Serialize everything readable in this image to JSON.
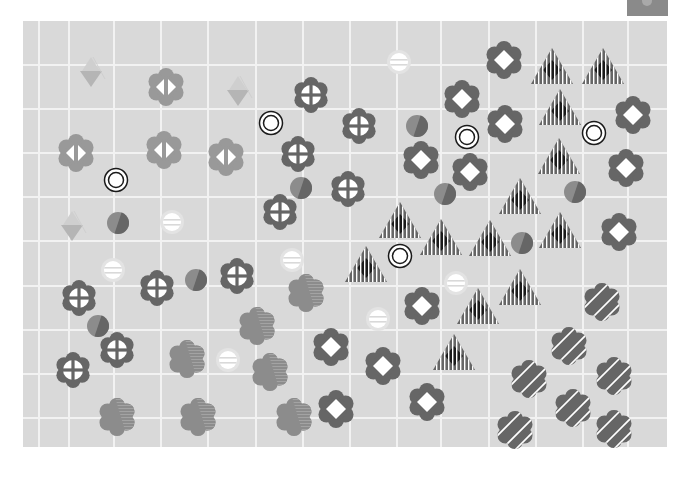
{
  "game": {
    "title": "Pattern Board",
    "corner_button": {
      "label": "",
      "icon": "menu-icon"
    },
    "board": {
      "x": 23,
      "y": 21,
      "width": 644,
      "height": 426,
      "background": "#d9d9d9",
      "grid_color": "#f2f2f2",
      "vlines": [
        15,
        45,
        90,
        137,
        184,
        232,
        279,
        326,
        373,
        417,
        465,
        512,
        559,
        604
      ],
      "hlines": [
        43,
        87,
        131,
        175,
        219,
        264,
        308,
        352,
        396
      ]
    },
    "colors": {
      "dark": "#666666",
      "mid": "#8c8c8c",
      "light": "#999999",
      "faint": "#b5b5b5",
      "white": "#ffffff",
      "black": "#1a1a1a"
    },
    "pieces": [
      {
        "type": "tri-down",
        "x": 91,
        "y": 73
      },
      {
        "type": "tri-down",
        "x": 238,
        "y": 92
      },
      {
        "type": "tri-down",
        "x": 72,
        "y": 227
      },
      {
        "type": "lr-flower",
        "x": 166,
        "y": 87
      },
      {
        "type": "lr-flower",
        "x": 76,
        "y": 153
      },
      {
        "type": "lr-flower",
        "x": 164,
        "y": 150
      },
      {
        "type": "lr-flower",
        "x": 226,
        "y": 157
      },
      {
        "type": "ring",
        "x": 271,
        "y": 123
      },
      {
        "type": "ring",
        "x": 116,
        "y": 180
      },
      {
        "type": "ring",
        "x": 467,
        "y": 137
      },
      {
        "type": "ring",
        "x": 594,
        "y": 133
      },
      {
        "type": "ring",
        "x": 400,
        "y": 256
      },
      {
        "type": "bar-dot",
        "x": 399,
        "y": 62
      },
      {
        "type": "bar-dot",
        "x": 172,
        "y": 222
      },
      {
        "type": "bar-dot",
        "x": 113,
        "y": 270
      },
      {
        "type": "bar-dot",
        "x": 292,
        "y": 260
      },
      {
        "type": "bar-dot",
        "x": 456,
        "y": 283
      },
      {
        "type": "bar-dot",
        "x": 378,
        "y": 319
      },
      {
        "type": "bar-dot",
        "x": 228,
        "y": 360
      },
      {
        "type": "cross-flower",
        "x": 311,
        "y": 95
      },
      {
        "type": "cross-flower",
        "x": 359,
        "y": 126
      },
      {
        "type": "cross-flower",
        "x": 298,
        "y": 154
      },
      {
        "type": "cross-flower",
        "x": 348,
        "y": 189
      },
      {
        "type": "cross-flower",
        "x": 280,
        "y": 212
      },
      {
        "type": "cross-flower",
        "x": 237,
        "y": 276
      },
      {
        "type": "cross-flower",
        "x": 157,
        "y": 288
      },
      {
        "type": "cross-flower",
        "x": 79,
        "y": 298
      },
      {
        "type": "cross-flower",
        "x": 117,
        "y": 350
      },
      {
        "type": "cross-flower",
        "x": 73,
        "y": 370
      },
      {
        "type": "half-dot",
        "x": 417,
        "y": 126
      },
      {
        "type": "half-dot",
        "x": 301,
        "y": 188
      },
      {
        "type": "half-dot",
        "x": 445,
        "y": 194
      },
      {
        "type": "half-dot",
        "x": 118,
        "y": 223
      },
      {
        "type": "half-dot",
        "x": 196,
        "y": 280
      },
      {
        "type": "half-dot",
        "x": 575,
        "y": 192
      },
      {
        "type": "half-dot",
        "x": 522,
        "y": 243
      },
      {
        "type": "half-dot",
        "x": 98,
        "y": 326
      },
      {
        "type": "diamond-flower",
        "x": 504,
        "y": 60
      },
      {
        "type": "diamond-flower",
        "x": 462,
        "y": 99
      },
      {
        "type": "diamond-flower",
        "x": 633,
        "y": 115
      },
      {
        "type": "diamond-flower",
        "x": 505,
        "y": 124
      },
      {
        "type": "diamond-flower",
        "x": 421,
        "y": 160
      },
      {
        "type": "diamond-flower",
        "x": 470,
        "y": 172
      },
      {
        "type": "diamond-flower",
        "x": 626,
        "y": 168
      },
      {
        "type": "diamond-flower",
        "x": 619,
        "y": 232
      },
      {
        "type": "diamond-flower",
        "x": 422,
        "y": 306
      },
      {
        "type": "diamond-flower",
        "x": 331,
        "y": 347
      },
      {
        "type": "diamond-flower",
        "x": 383,
        "y": 366
      },
      {
        "type": "diamond-flower",
        "x": 336,
        "y": 409
      },
      {
        "type": "diamond-flower",
        "x": 427,
        "y": 402
      },
      {
        "type": "tri-stripe",
        "x": 552,
        "y": 66
      },
      {
        "type": "tri-stripe",
        "x": 603,
        "y": 66
      },
      {
        "type": "tri-stripe",
        "x": 560,
        "y": 107
      },
      {
        "type": "tri-stripe",
        "x": 559,
        "y": 156
      },
      {
        "type": "tri-stripe",
        "x": 520,
        "y": 196
      },
      {
        "type": "tri-stripe",
        "x": 400,
        "y": 220
      },
      {
        "type": "tri-stripe",
        "x": 441,
        "y": 237
      },
      {
        "type": "tri-stripe",
        "x": 490,
        "y": 238
      },
      {
        "type": "tri-stripe",
        "x": 560,
        "y": 230
      },
      {
        "type": "tri-stripe",
        "x": 366,
        "y": 264
      },
      {
        "type": "tri-stripe",
        "x": 520,
        "y": 287
      },
      {
        "type": "tri-stripe",
        "x": 478,
        "y": 306
      },
      {
        "type": "tri-stripe",
        "x": 454,
        "y": 352
      },
      {
        "type": "half-flower",
        "x": 306,
        "y": 293
      },
      {
        "type": "half-flower",
        "x": 257,
        "y": 326
      },
      {
        "type": "half-flower",
        "x": 187,
        "y": 359
      },
      {
        "type": "half-flower",
        "x": 270,
        "y": 372
      },
      {
        "type": "half-flower",
        "x": 117,
        "y": 417
      },
      {
        "type": "half-flower",
        "x": 198,
        "y": 417
      },
      {
        "type": "half-flower",
        "x": 294,
        "y": 417
      },
      {
        "type": "stripe-flower",
        "x": 602,
        "y": 302
      },
      {
        "type": "stripe-flower",
        "x": 569,
        "y": 346
      },
      {
        "type": "stripe-flower",
        "x": 529,
        "y": 379
      },
      {
        "type": "stripe-flower",
        "x": 614,
        "y": 376
      },
      {
        "type": "stripe-flower",
        "x": 573,
        "y": 408
      },
      {
        "type": "stripe-flower",
        "x": 515,
        "y": 430
      },
      {
        "type": "stripe-flower",
        "x": 614,
        "y": 429
      }
    ]
  }
}
